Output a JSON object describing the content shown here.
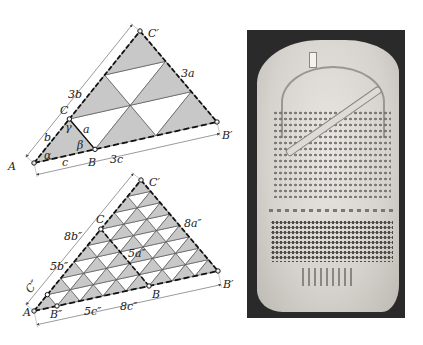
{
  "figure": {
    "top_diagram": {
      "description": "Triangle ABC scaled by 3 to AB'C', subdivided into 9 congruent triangles",
      "points": {
        "A": "A",
        "B": "B",
        "C": "C",
        "B_prime": "B′",
        "C_prime": "C′"
      },
      "side_labels": {
        "a": "a",
        "b": "b",
        "c": "c",
        "three_a": "3a",
        "three_b": "3b",
        "three_c": "3c"
      },
      "angle_labels": {
        "alpha": "α",
        "beta": "β",
        "gamma": "γ"
      },
      "fill_color": "#c8c8c8",
      "edge_color": "#222222"
    },
    "bottom_diagram": {
      "description": "Triangle with sides 5 and 8 units subdivided into small triangles",
      "points": {
        "A": "A",
        "B": "B",
        "C": "C",
        "B_prime": "B′",
        "C_prime": "C′",
        "B_dprime": "B″",
        "C_dprime": "C″"
      },
      "side_labels": {
        "five_b": "5b″",
        "eight_b": "8b″",
        "five_a": "5a″",
        "eight_a": "8a″",
        "five_c": "5c″",
        "eight_c": "8c″",
        "c_dprime": "C″"
      },
      "fill_color": "#c8c8c8"
    },
    "photo": {
      "description": "Photograph of carved stone tablet with grid of small marks",
      "background_color": "#2a2a2a"
    }
  }
}
